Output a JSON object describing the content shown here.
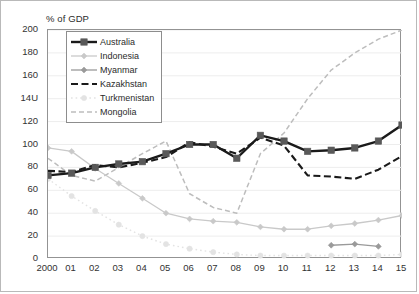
{
  "chart_data": {
    "type": "line",
    "title": "% of GDP",
    "xlabel": "",
    "ylabel": "",
    "ylim": [
      0,
      200
    ],
    "yticks": [
      0,
      20,
      40,
      60,
      80,
      100,
      120,
      140,
      160,
      180,
      200
    ],
    "ytick_labels": [
      "0",
      "20",
      "40",
      "60",
      "80",
      "100",
      "120",
      "14U",
      "160",
      "180",
      "200"
    ],
    "grid": true,
    "legend_position": "upper-left-inside",
    "x": [
      2000,
      2001,
      2002,
      2003,
      2004,
      2005,
      2006,
      2007,
      2008,
      2009,
      2010,
      2011,
      2012,
      2013,
      2014,
      2015
    ],
    "categories": [
      "2000",
      "01",
      "02",
      "03",
      "04",
      "05",
      "06",
      "07",
      "08",
      "09",
      "10",
      "11",
      "12",
      "13",
      "14",
      "15"
    ],
    "series": [
      {
        "name": "Australia",
        "color": "#1a1a1a",
        "style": "solid",
        "width": 2.4,
        "marker": "square",
        "marker_color": "#595959",
        "values": [
          73,
          75,
          80,
          83,
          85,
          92,
          100,
          100,
          88,
          108,
          103,
          94,
          95,
          97,
          103,
          117
        ]
      },
      {
        "name": "Indonesia",
        "color": "#c9c9c9",
        "style": "solid",
        "width": 1.3,
        "marker": "diamond",
        "marker_color": "#c9c9c9",
        "values": [
          97,
          94,
          79,
          66,
          53,
          40,
          35,
          33,
          32,
          28,
          26,
          26,
          29,
          31,
          34,
          38
        ]
      },
      {
        "name": "Myanmar",
        "color": "#9a9a9a",
        "style": "solid",
        "width": 1.3,
        "marker": "diamond",
        "marker_color": "#9a9a9a",
        "values": [
          null,
          null,
          null,
          null,
          null,
          null,
          null,
          null,
          null,
          null,
          null,
          null,
          12,
          13,
          11,
          null
        ]
      },
      {
        "name": "Kazakhstan",
        "color": "#1a1a1a",
        "style": "dashed",
        "width": 2.1,
        "marker": "none",
        "marker_color": "#1a1a1a",
        "values": [
          77,
          76,
          82,
          80,
          84,
          89,
          102,
          98,
          92,
          106,
          99,
          73,
          72,
          70,
          78,
          90
        ]
      },
      {
        "name": "Turkmenistan",
        "color": "#e3e3e3",
        "style": "dotted",
        "width": 1.4,
        "marker": "circle",
        "marker_color": "#e3e3e3",
        "values": [
          70,
          55,
          42,
          30,
          20,
          13,
          9,
          6,
          4,
          3,
          3,
          3,
          3,
          3,
          3,
          4
        ]
      },
      {
        "name": "Mongolia",
        "color": "#bdbdbd",
        "style": "dashed",
        "width": 1.5,
        "marker": "none",
        "marker_color": "#bdbdbd",
        "values": [
          88,
          73,
          68,
          80,
          92,
          103,
          57,
          45,
          40,
          92,
          110,
          140,
          165,
          180,
          192,
          200
        ]
      }
    ]
  },
  "legend": {
    "items": [
      {
        "label": "Australia"
      },
      {
        "label": "Indonesia"
      },
      {
        "label": "Myanmar"
      },
      {
        "label": "Kazakhstan"
      },
      {
        "label": "Turkmenistan"
      },
      {
        "label": "Mongolia"
      }
    ]
  },
  "colors": {
    "plot_border": "#939393",
    "figure_border": "#b9b9b9",
    "gridline": "#ededed",
    "text": "#333333",
    "background": "#ffffff"
  }
}
